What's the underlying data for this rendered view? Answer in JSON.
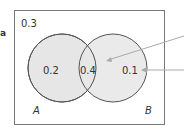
{
  "diagram": {
    "type": "venn",
    "stub_label": "a",
    "outside_value": "0.3",
    "only_a_value": "0.2",
    "intersection_value": "0.4",
    "only_b_value": "0.1",
    "set_a_label": "A",
    "set_b_label": "B",
    "colors": {
      "fill": "#e8e8e8",
      "stroke": "#555555",
      "border": "#777777",
      "arrow": "#aaaaaa"
    }
  }
}
